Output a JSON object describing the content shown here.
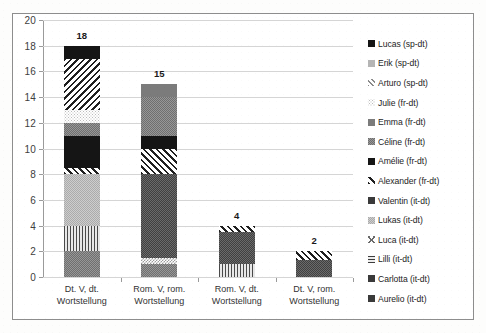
{
  "chart_data": {
    "type": "bar",
    "subtype": "stacked-bar",
    "title": "",
    "xlabel": "",
    "ylabel": "",
    "ylim": [
      0,
      20
    ],
    "ytick_step": 2,
    "yticks": [
      0,
      2,
      4,
      6,
      8,
      10,
      12,
      14,
      16,
      18,
      20
    ],
    "grid": true,
    "legend_position": "right",
    "categories": [
      "Dt. V, dt.\nWortstellung",
      "Rom. V, rom.\nWortstellung",
      "Rom. V, dt.\nWortstellung",
      "Dt. V, rom.\nWortstellung"
    ],
    "totals": [
      18,
      15,
      4,
      2
    ],
    "series": [
      {
        "name": "Aurelio (it-dt)",
        "values": [
          2,
          1,
          0,
          0
        ],
        "pattern": "grain-mgray",
        "swatch": "solid-dark"
      },
      {
        "name": "Carlotta (it-dt)",
        "values": [
          0,
          0.5,
          0,
          0
        ],
        "pattern": "checker-light",
        "swatch": "solid-dark"
      },
      {
        "name": "Lilli (it-dt)",
        "values": [
          2,
          0,
          1,
          0
        ],
        "pattern": "vert",
        "swatch": "horiz"
      },
      {
        "name": "Luca (it-dt)",
        "values": [
          0,
          0,
          0,
          0
        ],
        "pattern": "cross",
        "swatch": "cross"
      },
      {
        "name": "Lukas (it-dt)",
        "values": [
          4,
          0,
          0,
          0
        ],
        "pattern": "grain-lgray",
        "swatch": "grain-lgray"
      },
      {
        "name": "Valentin (it-dt)",
        "values": [
          0,
          6.5,
          2.5,
          1.3
        ],
        "pattern": "grain-dark",
        "swatch": "solid-dark"
      },
      {
        "name": "Alexander (fr-dt)",
        "values": [
          0.5,
          2,
          0.5,
          0.7
        ],
        "pattern": "diag-up",
        "swatch": "diag-up"
      },
      {
        "name": "Amélie (fr-dt)",
        "values": [
          2.5,
          1,
          0,
          0
        ],
        "pattern": "solid-black",
        "swatch": "solid-black"
      },
      {
        "name": "Céline (fr-dt)",
        "values": [
          1,
          3,
          0,
          0
        ],
        "pattern": "grain-mgray",
        "swatch": "grain-mgray"
      },
      {
        "name": "Emma (fr-dt)",
        "values": [
          0,
          1,
          0,
          0
        ],
        "pattern": "solid-mgray",
        "swatch": "solid-mgray"
      },
      {
        "name": "Julie (fr-dt)",
        "values": [
          1,
          0,
          0,
          0
        ],
        "pattern": "dots-light",
        "swatch": "dots-light"
      },
      {
        "name": "Arturo (sp-dt)",
        "values": [
          4,
          0,
          0,
          0
        ],
        "pattern": "diag-down",
        "swatch": "diag-light"
      },
      {
        "name": "Erik (sp-dt)",
        "values": [
          0,
          0,
          0,
          0
        ],
        "pattern": "solid-lgray",
        "swatch": "solid-lgray"
      },
      {
        "name": "Lucas (sp-dt)",
        "values": [
          1,
          0,
          0,
          0
        ],
        "pattern": "solid-black",
        "swatch": "solid-black"
      }
    ],
    "legend_order": [
      "Lucas (sp-dt)",
      "Erik (sp-dt)",
      "Arturo (sp-dt)",
      "Julie (fr-dt)",
      "Emma (fr-dt)",
      "Céline (fr-dt)",
      "Amélie (fr-dt)",
      "Alexander (fr-dt)",
      "Valentin (it-dt)",
      "Lukas (it-dt)",
      "Luca (it-dt)",
      "Lilli (it-dt)",
      "Carlotta (it-dt)",
      "Aurelio (it-dt)"
    ]
  }
}
